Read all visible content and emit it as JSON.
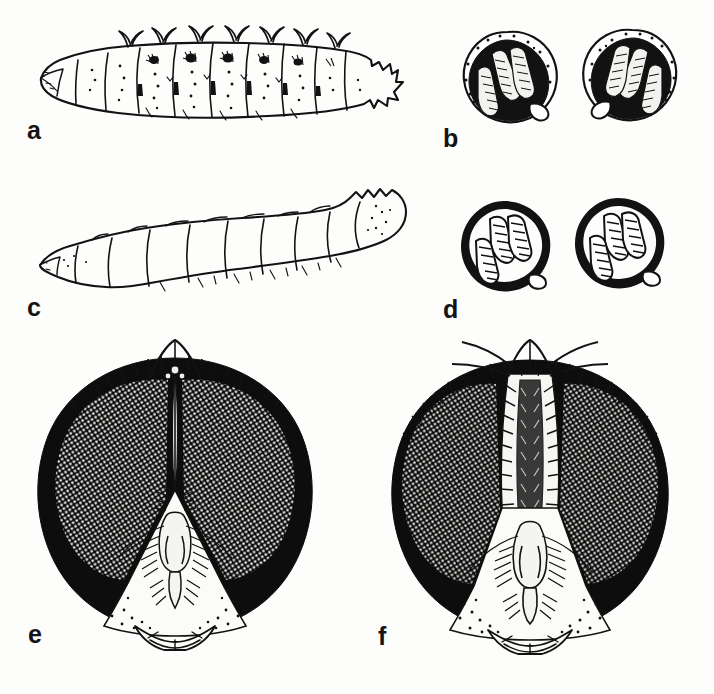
{
  "figure": {
    "type": "scientific-illustration-plate",
    "background_color": "#fdfdfc",
    "ink_color": "#121212",
    "width": 714,
    "height": 694,
    "panel_count": 6
  },
  "panels": [
    {
      "id": "a",
      "label": "a",
      "label_x": 27,
      "label_y": 118,
      "subject": "larva-lateral-spined",
      "caption_text": "larva, lateral view, with dorsal spine-like processes",
      "segment_count": 11,
      "bbox": [
        30,
        25,
        400,
        95
      ]
    },
    {
      "id": "b",
      "label": "b",
      "label_x": 443,
      "label_y": 126,
      "subject": "posterior-spiracles-dark",
      "caption_text": "posterior spiracles, heavily sclerotised peritreme",
      "spiracle_count": 2,
      "slits_per_spiracle": 3,
      "bbox": [
        452,
        28,
        240,
        100
      ]
    },
    {
      "id": "c",
      "label": "c",
      "label_x": 27,
      "label_y": 295,
      "subject": "larva-lateral-smooth",
      "caption_text": "larva, lateral view, smooth integument",
      "segment_count": 11,
      "bbox": [
        30,
        190,
        390,
        105
      ]
    },
    {
      "id": "d",
      "label": "d",
      "label_x": 443,
      "label_y": 297,
      "subject": "posterior-spiracles-open",
      "caption_text": "posterior spiracles, narrow peritreme with open slits",
      "spiracle_count": 2,
      "slits_per_spiracle": 3,
      "bbox": [
        452,
        200,
        225,
        95
      ]
    },
    {
      "id": "e",
      "label": "e",
      "label_x": 28,
      "label_y": 622,
      "subject": "head-male-holoptic",
      "caption_text": "head of male, frontal view, eyes nearly touching (holoptic)",
      "eye_state": "holoptic",
      "bbox": [
        35,
        352,
        296,
        300
      ]
    },
    {
      "id": "f",
      "label": "f",
      "label_x": 378,
      "label_y": 624,
      "subject": "head-female-dichoptic",
      "caption_text": "head of female, frontal view, eyes widely separated (dichoptic)",
      "eye_state": "dichoptic",
      "bbox": [
        404,
        350,
        290,
        302
      ]
    }
  ]
}
